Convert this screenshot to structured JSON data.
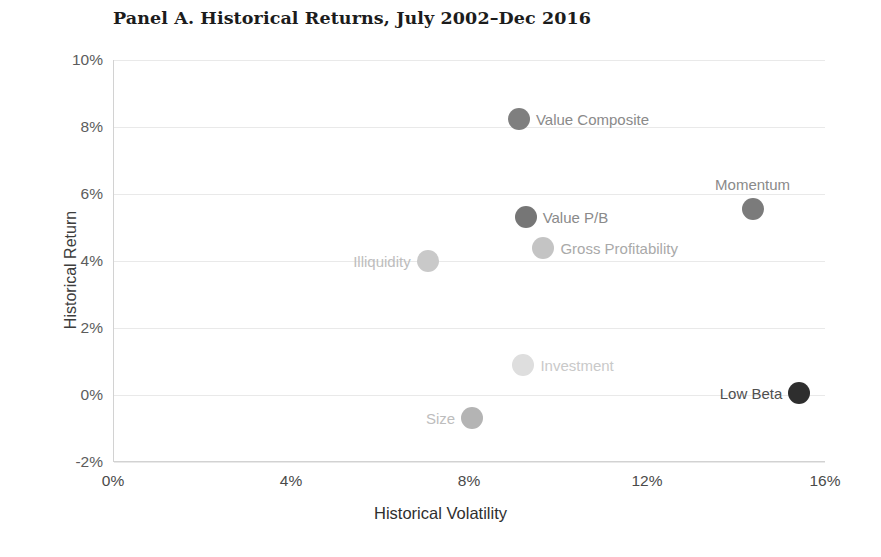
{
  "chart_data": {
    "type": "scatter",
    "title": "Panel A. Historical Returns, July 2002–Dec 2016",
    "xlabel": "Historical Volatility",
    "ylabel": "Historical Return",
    "xlim": [
      0,
      16
    ],
    "ylim": [
      -2,
      10
    ],
    "grid": true,
    "legend": "none",
    "xticks": [
      "0%",
      "4%",
      "8%",
      "12%",
      "16%"
    ],
    "xtick_values": [
      0,
      4,
      8,
      12,
      16
    ],
    "yticks": [
      "10%",
      "8%",
      "6%",
      "4%",
      "2%",
      "0%",
      "-2%"
    ],
    "ytick_values": [
      10,
      8,
      6,
      4,
      2,
      0,
      -2
    ],
    "points": [
      {
        "label": "Value Composite",
        "x": 9.1,
        "y": 8.25,
        "color": "#7f7f7f",
        "radius": 11,
        "label_color": "#8a8a8a",
        "label_position": "right"
      },
      {
        "label": "Momentum",
        "x": 14.35,
        "y": 5.55,
        "color": "#7b7b7b",
        "radius": 11,
        "label_color": "#8a8a8a",
        "label_position": "above"
      },
      {
        "label": "Value P/B",
        "x": 9.25,
        "y": 5.3,
        "color": "#767676",
        "radius": 11,
        "label_color": "#8a8a8a",
        "label_position": "right"
      },
      {
        "label": "Gross Profitability",
        "x": 9.65,
        "y": 4.4,
        "color": "#c4c4c4",
        "radius": 11,
        "label_color": "#a9a9a9",
        "label_position": "right"
      },
      {
        "label": "Illiquidity",
        "x": 7.05,
        "y": 4.0,
        "color": "#c9c9c9",
        "radius": 11,
        "label_color": "#bdbdbd",
        "label_position": "left"
      },
      {
        "label": "Investment",
        "x": 9.2,
        "y": 0.9,
        "color": "#dedede",
        "radius": 11,
        "label_color": "#c9c9c9",
        "label_position": "right"
      },
      {
        "label": "Size",
        "x": 8.05,
        "y": -0.7,
        "color": "#b4b4b4",
        "radius": 11,
        "label_color": "#bdbdbd",
        "label_position": "left"
      },
      {
        "label": "Low Beta",
        "x": 15.4,
        "y": 0.05,
        "color": "#2e2e2e",
        "radius": 11,
        "label_color": "#4f4f4f",
        "label_position": "left"
      }
    ]
  }
}
